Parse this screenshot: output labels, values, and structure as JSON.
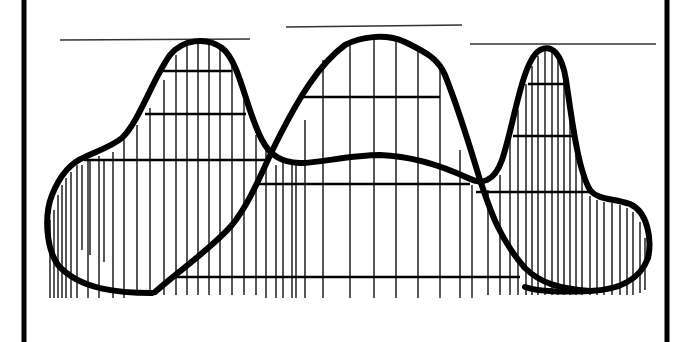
{
  "diagram": {
    "type": "line-art surface profile",
    "colors": {
      "ink": "#000000",
      "background": "#ffffff"
    },
    "frame": {
      "left_x": 24,
      "right_x": 667
    },
    "reference_lines": [
      {
        "x1": 60,
        "x2": 250,
        "y": 40
      },
      {
        "x1": 286,
        "x2": 462,
        "y": 26
      },
      {
        "x1": 470,
        "x2": 656,
        "y": 44
      }
    ],
    "baseline_y": 298,
    "peaks": [
      {
        "name": "left-back-peak",
        "x": 198,
        "y": 40
      },
      {
        "name": "center-front-peak",
        "x": 376,
        "y": 36
      },
      {
        "name": "right-back-peak",
        "x": 545,
        "y": 46
      }
    ],
    "contour_levels": [
      {
        "x1": 163,
        "x2": 232,
        "y": 71
      },
      {
        "x1": 145,
        "x2": 246,
        "y": 114
      },
      {
        "x1": 84,
        "x2": 268,
        "y": 160
      },
      {
        "x1": 302,
        "x2": 440,
        "y": 97
      },
      {
        "x1": 258,
        "x2": 470,
        "y": 184
      },
      {
        "x1": 175,
        "x2": 520,
        "y": 277
      },
      {
        "x1": 528,
        "x2": 565,
        "y": 84
      },
      {
        "x1": 513,
        "x2": 575,
        "y": 136
      },
      {
        "x1": 476,
        "x2": 590,
        "y": 192
      }
    ]
  }
}
